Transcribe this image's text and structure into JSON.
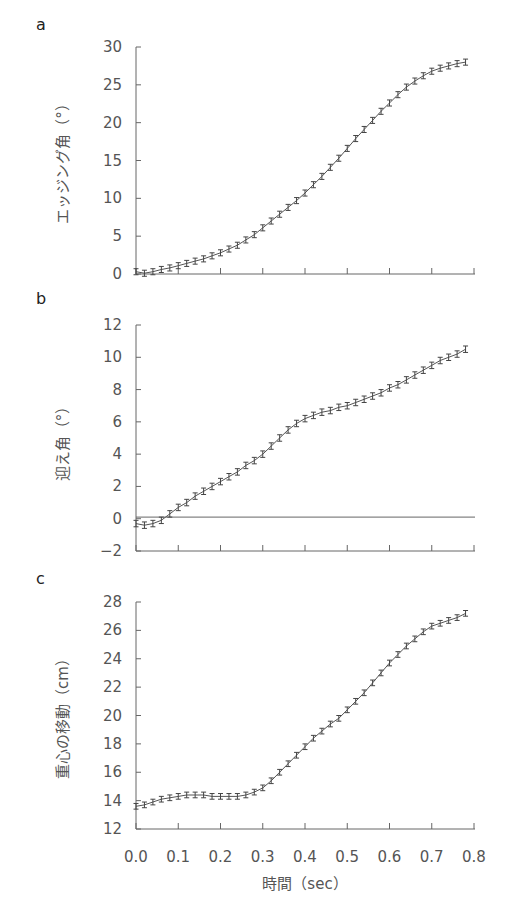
{
  "figure": {
    "xlabel": "時間（sec）",
    "x_ticks": [
      "0.0",
      "0.1",
      "0.2",
      "0.3",
      "0.4",
      "0.5",
      "0.6",
      "0.7",
      "0.8"
    ]
  },
  "chart_data": [
    {
      "panel": "a",
      "type": "line",
      "ylabel": "エッジング角（°）",
      "xlabel": "時間（sec）",
      "xlim": [
        0,
        0.8
      ],
      "ylim": [
        0,
        30
      ],
      "y_ticks": [
        "0",
        "5",
        "10",
        "15",
        "20",
        "25",
        "30"
      ],
      "x": [
        0,
        0.02,
        0.04,
        0.06,
        0.08,
        0.1,
        0.12,
        0.14,
        0.16,
        0.18,
        0.2,
        0.22,
        0.24,
        0.26,
        0.28,
        0.3,
        0.32,
        0.34,
        0.36,
        0.38,
        0.4,
        0.42,
        0.44,
        0.46,
        0.48,
        0.5,
        0.52,
        0.54,
        0.56,
        0.58,
        0.6,
        0.62,
        0.64,
        0.66,
        0.68,
        0.7,
        0.72,
        0.74,
        0.76,
        0.78
      ],
      "values": [
        0.3,
        0.1,
        0.3,
        0.6,
        0.8,
        1.1,
        1.4,
        1.7,
        2.0,
        2.4,
        2.8,
        3.3,
        3.8,
        4.5,
        5.2,
        6.1,
        7.0,
        7.9,
        8.8,
        9.7,
        10.7,
        11.8,
        12.9,
        14.1,
        15.3,
        16.6,
        17.9,
        19.1,
        20.3,
        21.5,
        22.6,
        23.7,
        24.7,
        25.5,
        26.2,
        26.8,
        27.2,
        27.5,
        27.8,
        28.0
      ],
      "error": 0.4,
      "reference_line": null,
      "grid": false
    },
    {
      "panel": "b",
      "type": "line",
      "ylabel": "迎え角（°）",
      "xlabel": "時間（sec）",
      "xlim": [
        0,
        0.8
      ],
      "ylim": [
        -2,
        12
      ],
      "y_ticks": [
        "-2",
        "0",
        "2",
        "4",
        "6",
        "8",
        "10",
        "12"
      ],
      "x": [
        0,
        0.02,
        0.04,
        0.06,
        0.08,
        0.1,
        0.12,
        0.14,
        0.16,
        0.18,
        0.2,
        0.22,
        0.24,
        0.26,
        0.28,
        0.3,
        0.32,
        0.34,
        0.36,
        0.38,
        0.4,
        0.42,
        0.44,
        0.46,
        0.48,
        0.5,
        0.52,
        0.54,
        0.56,
        0.58,
        0.6,
        0.62,
        0.64,
        0.66,
        0.68,
        0.7,
        0.72,
        0.74,
        0.76,
        0.78
      ],
      "values": [
        -0.3,
        -0.4,
        -0.3,
        -0.1,
        0.3,
        0.7,
        1.0,
        1.4,
        1.7,
        2.0,
        2.3,
        2.6,
        2.9,
        3.3,
        3.6,
        4.0,
        4.5,
        5.0,
        5.5,
        5.9,
        6.2,
        6.4,
        6.6,
        6.7,
        6.9,
        7.0,
        7.2,
        7.4,
        7.6,
        7.8,
        8.1,
        8.3,
        8.6,
        8.9,
        9.2,
        9.5,
        9.8,
        10.0,
        10.2,
        10.5
      ],
      "error": 0.2,
      "reference_line": 0.1,
      "grid": false
    },
    {
      "panel": "c",
      "type": "line",
      "ylabel": "重心の移動（cm）",
      "xlabel": "時間（sec）",
      "xlim": [
        0,
        0.8
      ],
      "ylim": [
        12,
        28
      ],
      "y_ticks": [
        "12",
        "14",
        "16",
        "18",
        "20",
        "22",
        "24",
        "26",
        "28"
      ],
      "x": [
        0,
        0.02,
        0.04,
        0.06,
        0.08,
        0.1,
        0.12,
        0.14,
        0.16,
        0.18,
        0.2,
        0.22,
        0.24,
        0.26,
        0.28,
        0.3,
        0.32,
        0.34,
        0.36,
        0.38,
        0.4,
        0.42,
        0.44,
        0.46,
        0.48,
        0.5,
        0.52,
        0.54,
        0.56,
        0.58,
        0.6,
        0.62,
        0.64,
        0.66,
        0.68,
        0.7,
        0.72,
        0.74,
        0.76,
        0.78
      ],
      "values": [
        13.6,
        13.7,
        13.9,
        14.1,
        14.2,
        14.3,
        14.4,
        14.4,
        14.4,
        14.3,
        14.3,
        14.3,
        14.3,
        14.4,
        14.6,
        14.9,
        15.4,
        16.0,
        16.6,
        17.2,
        17.8,
        18.4,
        18.9,
        19.4,
        19.8,
        20.4,
        21.0,
        21.6,
        22.3,
        23.0,
        23.7,
        24.3,
        24.9,
        25.4,
        25.9,
        26.3,
        26.5,
        26.7,
        26.9,
        27.2
      ],
      "error": 0.2,
      "reference_line": null,
      "grid": false
    }
  ]
}
